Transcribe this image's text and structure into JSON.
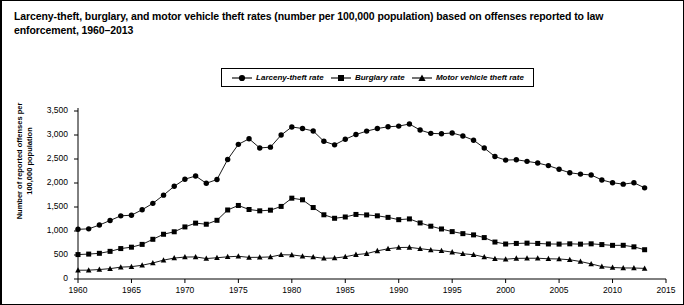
{
  "title": "Larceny-theft, burglary, and motor vehicle theft rates (number per 100,000 population) based on offenses reported to law enforcement, 1960–2013",
  "legend": {
    "items": [
      {
        "label": "Larceny-theft rate",
        "marker": "circle"
      },
      {
        "label": "Burglary rate",
        "marker": "square"
      },
      {
        "label": "Motor vehicle theft rate",
        "marker": "triangle"
      }
    ]
  },
  "chart_data": {
    "type": "line",
    "title": "Larceny-theft, burglary, and motor vehicle theft rates (number per 100,000 population) based on offenses reported to law enforcement, 1960–2013",
    "xlabel": "",
    "ylabel": "Number of reported offenses per 100,000 population",
    "xlim": [
      1960,
      2015
    ],
    "ylim": [
      0,
      3500
    ],
    "xticks": [
      1960,
      1965,
      1970,
      1975,
      1980,
      1985,
      1990,
      1995,
      2000,
      2005,
      2010,
      2015
    ],
    "xtick_labels": [
      "1960",
      "1965",
      "1970",
      "1975",
      "1980",
      "1985",
      "1990",
      "1995",
      "2000",
      "2005",
      "2010",
      "2015"
    ],
    "yticks": [
      0,
      500,
      1000,
      1500,
      2000,
      2500,
      3000,
      3500
    ],
    "ytick_labels": [
      "0",
      "500",
      "1,000",
      "1,500",
      "2,000",
      "2,500",
      "3,000",
      "3,500"
    ],
    "grid": false,
    "legend_position": "top-center",
    "x": [
      1960,
      1961,
      1962,
      1963,
      1964,
      1965,
      1966,
      1967,
      1968,
      1969,
      1970,
      1971,
      1972,
      1973,
      1974,
      1975,
      1976,
      1977,
      1978,
      1979,
      1980,
      1981,
      1982,
      1983,
      1984,
      1985,
      1986,
      1987,
      1988,
      1989,
      1990,
      1991,
      1992,
      1993,
      1994,
      1995,
      1996,
      1997,
      1998,
      1999,
      2000,
      2001,
      2002,
      2003,
      2004,
      2005,
      2006,
      2007,
      2008,
      2009,
      2010,
      2011,
      2012,
      2013
    ],
    "series": [
      {
        "name": "Larceny-theft rate",
        "marker": "circle",
        "values": [
          1035,
          1045,
          1124,
          1219,
          1316,
          1329,
          1443,
          1576,
          1747,
          1931,
          2079,
          2146,
          1994,
          2072,
          2490,
          2805,
          2921,
          2730,
          2747,
          2999,
          3167,
          3135,
          3084,
          2869,
          2795,
          2911,
          3010,
          3081,
          3135,
          3171,
          3185,
          3229,
          3103,
          3034,
          3026,
          3043,
          2980,
          2892,
          2729,
          2551,
          2477,
          2485,
          2451,
          2416,
          2362,
          2287,
          2213,
          2185,
          2167,
          2064,
          2005,
          1976,
          2005,
          1899
        ]
      },
      {
        "name": "Burglary rate",
        "marker": "square",
        "values": [
          509,
          519,
          535,
          576,
          634,
          663,
          721,
          827,
          932,
          984,
          1085,
          1164,
          1141,
          1223,
          1438,
          1532,
          1448,
          1420,
          1434,
          1512,
          1684,
          1650,
          1489,
          1338,
          1265,
          1292,
          1345,
          1335,
          1316,
          1284,
          1236,
          1252,
          1168,
          1100,
          1042,
          987,
          945,
          919,
          863,
          770,
          729,
          741,
          747,
          741,
          730,
          727,
          733,
          726,
          733,
          717,
          701,
          702,
          670,
          610
        ]
      },
      {
        "name": "Motor vehicle theft rate",
        "marker": "triangle",
        "values": [
          183,
          184,
          197,
          216,
          247,
          257,
          286,
          334,
          393,
          436,
          457,
          460,
          426,
          443,
          462,
          474,
          450,
          452,
          460,
          505,
          502,
          475,
          459,
          431,
          437,
          463,
          508,
          529,
          586,
          630,
          656,
          659,
          632,
          606,
          591,
          560,
          526,
          506,
          459,
          422,
          412,
          430,
          432,
          433,
          421,
          417,
          401,
          364,
          315,
          259,
          239,
          230,
          229,
          221
        ]
      }
    ]
  }
}
